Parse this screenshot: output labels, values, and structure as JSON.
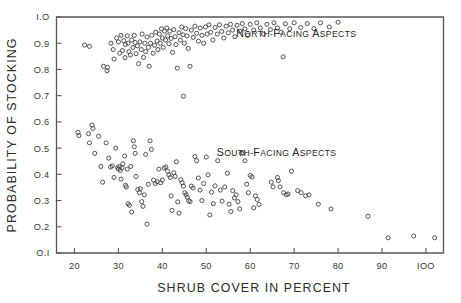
{
  "chart_data": {
    "type": "scatter",
    "title": "",
    "xlabel": "SHRUB COVER IN PERCENT",
    "ylabel": "PROBABILITY OF STOCKING",
    "xlim": [
      15.9,
      104.0
    ],
    "ylim": [
      0.1,
      1.0
    ],
    "xticks": [
      20,
      30,
      40,
      50,
      60,
      70,
      80,
      90,
      100
    ],
    "xticklabels": [
      "20",
      "30",
      "40",
      "50",
      "60",
      "70",
      "80",
      "90",
      "IOO"
    ],
    "yticks": [
      0.1,
      0.2,
      0.3,
      0.4,
      0.5,
      0.6,
      0.7,
      0.8,
      0.9,
      1.0
    ],
    "yticklabels": [
      "O.I",
      "O.2",
      "O.3",
      "O.4",
      "O.5",
      "O.6",
      "O.7",
      "O.8",
      "O.9",
      "I.O"
    ],
    "grid": false,
    "legend_position": "inside-annotations",
    "marker": "open-circle",
    "marker_color": "#4a4a4a",
    "annotations": [
      {
        "name": "north-facing-label",
        "text": "North-Facing Aspects",
        "x": 70.5,
        "y": 0.925
      },
      {
        "name": "south-facing-label",
        "text": "South-Facing Aspects",
        "x": 66.0,
        "y": 0.47
      }
    ],
    "series": [
      {
        "name": "North-facing aspects",
        "points": [
          [
            22.3,
            0.893
          ],
          [
            23.4,
            0.888
          ],
          [
            26.6,
            0.812
          ],
          [
            27.4,
            0.795
          ],
          [
            27.5,
            0.808
          ],
          [
            28.3,
            0.9
          ],
          [
            28.8,
            0.876
          ],
          [
            29.0,
            0.84
          ],
          [
            29.6,
            0.92
          ],
          [
            30.0,
            0.905
          ],
          [
            30.3,
            0.862
          ],
          [
            30.6,
            0.93
          ],
          [
            30.9,
            0.872
          ],
          [
            31.2,
            0.91
          ],
          [
            31.5,
            0.845
          ],
          [
            31.6,
            0.895
          ],
          [
            32.0,
            0.928
          ],
          [
            32.2,
            0.9
          ],
          [
            32.4,
            0.868
          ],
          [
            32.7,
            0.855
          ],
          [
            33.0,
            0.912
          ],
          [
            33.3,
            0.884
          ],
          [
            33.6,
            0.93
          ],
          [
            33.8,
            0.903
          ],
          [
            34.0,
            0.86
          ],
          [
            34.3,
            0.89
          ],
          [
            34.6,
            0.822
          ],
          [
            34.9,
            0.905
          ],
          [
            35.2,
            0.876
          ],
          [
            35.4,
            0.935
          ],
          [
            35.7,
            0.846
          ],
          [
            36.0,
            0.9
          ],
          [
            36.2,
            0.868
          ],
          [
            36.5,
            0.924
          ],
          [
            36.8,
            0.884
          ],
          [
            37.0,
            0.812
          ],
          [
            37.3,
            0.9
          ],
          [
            37.6,
            0.93
          ],
          [
            37.9,
            0.862
          ],
          [
            38.2,
            0.892
          ],
          [
            38.5,
            0.942
          ],
          [
            38.8,
            0.908
          ],
          [
            39.0,
            0.876
          ],
          [
            39.3,
            0.935
          ],
          [
            39.5,
            0.9
          ],
          [
            39.8,
            0.955
          ],
          [
            40.0,
            0.92
          ],
          [
            40.2,
            0.884
          ],
          [
            40.5,
            0.946
          ],
          [
            40.7,
            0.912
          ],
          [
            41.0,
            0.958
          ],
          [
            41.2,
            0.928
          ],
          [
            41.5,
            0.898
          ],
          [
            41.7,
            0.946
          ],
          [
            42.0,
            0.918
          ],
          [
            42.3,
            0.865
          ],
          [
            42.6,
            0.952
          ],
          [
            42.9,
            0.925
          ],
          [
            43.1,
            0.895
          ],
          [
            43.4,
            0.805
          ],
          [
            43.8,
            0.94
          ],
          [
            44.1,
            0.912
          ],
          [
            44.4,
            0.962
          ],
          [
            44.7,
            0.932
          ],
          [
            45.0,
            0.9
          ],
          [
            45.3,
            0.956
          ],
          [
            45.6,
            0.928
          ],
          [
            45.9,
            0.88
          ],
          [
            46.3,
            0.812
          ],
          [
            46.6,
            0.95
          ],
          [
            47.0,
            0.922
          ],
          [
            47.4,
            0.965
          ],
          [
            47.8,
            0.938
          ],
          [
            48.2,
            0.908
          ],
          [
            48.6,
            0.958
          ],
          [
            49.0,
            0.93
          ],
          [
            49.4,
            0.9
          ],
          [
            49.8,
            0.962
          ],
          [
            50.2,
            0.935
          ],
          [
            50.6,
            0.97
          ],
          [
            51.0,
            0.942
          ],
          [
            51.5,
            0.912
          ],
          [
            52.0,
            0.96
          ],
          [
            52.5,
            0.935
          ],
          [
            53.0,
            0.97
          ],
          [
            53.5,
            0.945
          ],
          [
            54.0,
            0.92
          ],
          [
            54.5,
            0.965
          ],
          [
            55.0,
            0.94
          ],
          [
            55.5,
            0.972
          ],
          [
            56.0,
            0.95
          ],
          [
            56.5,
            0.925
          ],
          [
            57.0,
            0.968
          ],
          [
            57.6,
            0.946
          ],
          [
            58.2,
            0.975
          ],
          [
            58.8,
            0.955
          ],
          [
            59.4,
            0.93
          ],
          [
            60.0,
            0.972
          ],
          [
            60.8,
            0.95
          ],
          [
            61.5,
            0.978
          ],
          [
            62.3,
            0.958
          ],
          [
            63.0,
            0.935
          ],
          [
            63.8,
            0.972
          ],
          [
            64.6,
            0.952
          ],
          [
            65.4,
            0.978
          ],
          [
            66.2,
            0.958
          ],
          [
            67.0,
            0.942
          ],
          [
            68.0,
            0.974
          ],
          [
            69.0,
            0.955
          ],
          [
            70.0,
            0.978
          ],
          [
            71.5,
            0.96
          ],
          [
            73.0,
            0.975
          ],
          [
            74.5,
            0.956
          ],
          [
            76.0,
            0.978
          ],
          [
            78.0,
            0.962
          ],
          [
            80.0,
            0.98
          ],
          [
            44.8,
            0.698
          ],
          [
            67.5,
            0.848
          ]
        ]
      },
      {
        "name": "South-facing aspects",
        "points": [
          [
            20.8,
            0.56
          ],
          [
            21.0,
            0.548
          ],
          [
            23.2,
            0.555
          ],
          [
            23.4,
            0.52
          ],
          [
            24.0,
            0.588
          ],
          [
            24.2,
            0.575
          ],
          [
            24.6,
            0.48
          ],
          [
            25.5,
            0.545
          ],
          [
            26.0,
            0.43
          ],
          [
            26.4,
            0.37
          ],
          [
            27.2,
            0.52
          ],
          [
            27.8,
            0.462
          ],
          [
            28.2,
            0.428
          ],
          [
            28.6,
            0.432
          ],
          [
            29.0,
            0.388
          ],
          [
            29.4,
            0.5
          ],
          [
            29.8,
            0.425
          ],
          [
            30.0,
            0.42
          ],
          [
            30.2,
            0.43
          ],
          [
            30.4,
            0.415
          ],
          [
            30.6,
            0.382
          ],
          [
            30.8,
            0.425
          ],
          [
            31.0,
            0.44
          ],
          [
            31.4,
            0.47
          ],
          [
            31.6,
            0.358
          ],
          [
            31.8,
            0.352
          ],
          [
            32.0,
            0.42
          ],
          [
            32.2,
            0.288
          ],
          [
            32.5,
            0.282
          ],
          [
            32.8,
            0.43
          ],
          [
            33.0,
            0.256
          ],
          [
            33.4,
            0.528
          ],
          [
            33.6,
            0.505
          ],
          [
            33.8,
            0.48
          ],
          [
            34.0,
            0.392
          ],
          [
            34.4,
            0.342
          ],
          [
            34.8,
            0.33
          ],
          [
            35.0,
            0.345
          ],
          [
            35.3,
            0.296
          ],
          [
            35.6,
            0.278
          ],
          [
            35.9,
            0.322
          ],
          [
            36.2,
            0.476
          ],
          [
            36.5,
            0.21
          ],
          [
            36.8,
            0.362
          ],
          [
            37.2,
            0.528
          ],
          [
            37.5,
            0.495
          ],
          [
            38.0,
            0.378
          ],
          [
            38.4,
            0.365
          ],
          [
            38.8,
            0.372
          ],
          [
            39.2,
            0.42
          ],
          [
            39.6,
            0.368
          ],
          [
            40.0,
            0.378
          ],
          [
            40.4,
            0.424
          ],
          [
            40.8,
            0.428
          ],
          [
            41.2,
            0.412
          ],
          [
            41.5,
            0.398
          ],
          [
            41.8,
            0.388
          ],
          [
            42.0,
            0.318
          ],
          [
            42.2,
            0.262
          ],
          [
            42.6,
            0.406
          ],
          [
            42.9,
            0.392
          ],
          [
            43.2,
            0.448
          ],
          [
            43.5,
            0.295
          ],
          [
            43.8,
            0.252
          ],
          [
            44.2,
            0.38
          ],
          [
            44.5,
            0.368
          ],
          [
            44.8,
            0.355
          ],
          [
            45.1,
            0.33
          ],
          [
            45.4,
            0.322
          ],
          [
            45.7,
            0.312
          ],
          [
            46.0,
            0.3
          ],
          [
            46.3,
            0.296
          ],
          [
            46.6,
            0.355
          ],
          [
            47.0,
            0.348
          ],
          [
            47.4,
            0.468
          ],
          [
            47.8,
            0.452
          ],
          [
            48.2,
            0.386
          ],
          [
            48.6,
            0.34
          ],
          [
            49.0,
            0.3
          ],
          [
            49.4,
            0.365
          ],
          [
            50.0,
            0.466
          ],
          [
            50.4,
            0.398
          ],
          [
            50.8,
            0.245
          ],
          [
            51.2,
            0.332
          ],
          [
            51.6,
            0.288
          ],
          [
            52.0,
            0.356
          ],
          [
            52.6,
            0.452
          ],
          [
            53.2,
            0.34
          ],
          [
            53.6,
            0.298
          ],
          [
            54.2,
            0.352
          ],
          [
            54.8,
            0.404
          ],
          [
            55.2,
            0.286
          ],
          [
            55.6,
            0.258
          ],
          [
            56.0,
            0.338
          ],
          [
            56.4,
            0.31
          ],
          [
            56.8,
            0.322
          ],
          [
            57.2,
            0.296
          ],
          [
            57.6,
            0.268
          ],
          [
            58.0,
            0.48
          ],
          [
            58.4,
            0.482
          ],
          [
            58.8,
            0.452
          ],
          [
            59.2,
            0.362
          ],
          [
            59.6,
            0.33
          ],
          [
            60.0,
            0.396
          ],
          [
            60.4,
            0.39
          ],
          [
            60.8,
            0.272
          ],
          [
            61.2,
            0.318
          ],
          [
            61.6,
            0.304
          ],
          [
            62.0,
            0.285
          ],
          [
            64.8,
            0.37
          ],
          [
            65.2,
            0.352
          ],
          [
            66.2,
            0.388
          ],
          [
            66.4,
            0.376
          ],
          [
            66.8,
            0.352
          ],
          [
            67.6,
            0.33
          ],
          [
            68.2,
            0.322
          ],
          [
            68.6,
            0.325
          ],
          [
            69.4,
            0.412
          ],
          [
            70.8,
            0.338
          ],
          [
            71.6,
            0.33
          ],
          [
            72.6,
            0.318
          ],
          [
            73.4,
            0.322
          ],
          [
            75.5,
            0.286
          ],
          [
            78.4,
            0.268
          ],
          [
            86.8,
            0.24
          ],
          [
            91.4,
            0.158
          ],
          [
            97.2,
            0.165
          ],
          [
            102.0,
            0.158
          ]
        ]
      }
    ]
  }
}
